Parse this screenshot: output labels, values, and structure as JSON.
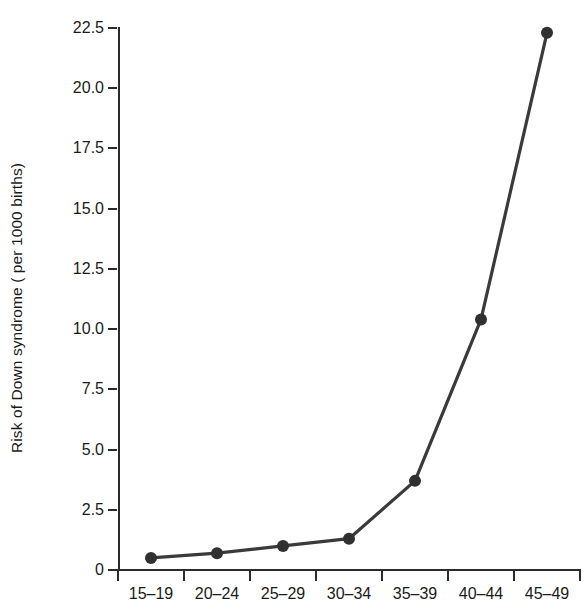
{
  "chart_data": {
    "type": "line",
    "title": "",
    "xlabel": "",
    "ylabel": "Risk of Down syndrome ( per 1000 births)",
    "categories": [
      "15–19",
      "20–24",
      "25–29",
      "30–34",
      "35–39",
      "40–44",
      "45–49"
    ],
    "values": [
      0.5,
      0.7,
      1.0,
      1.3,
      3.7,
      10.4,
      22.3
    ],
    "series": [
      {
        "name": "Risk of Down syndrome",
        "values": [
          0.5,
          0.7,
          1.0,
          1.3,
          3.7,
          10.4,
          22.3
        ]
      }
    ],
    "ylim": [
      0,
      22.5
    ],
    "yticks": [
      0,
      2.5,
      5.0,
      7.5,
      10.0,
      12.5,
      15.0,
      17.5,
      20.0,
      22.5
    ],
    "ytick_labels": [
      "0",
      "2.5",
      "5.0",
      "7.5",
      "10.0",
      "12.5",
      "15.0",
      "17.5",
      "20.0",
      "22.5"
    ],
    "grid": false,
    "legend": false,
    "legend_position": "none",
    "marker": "filled-circle",
    "line_color": "#3a3a3a",
    "marker_color": "#303030",
    "axis_color": "#2b2b2b",
    "background_color": "#ffffff"
  }
}
